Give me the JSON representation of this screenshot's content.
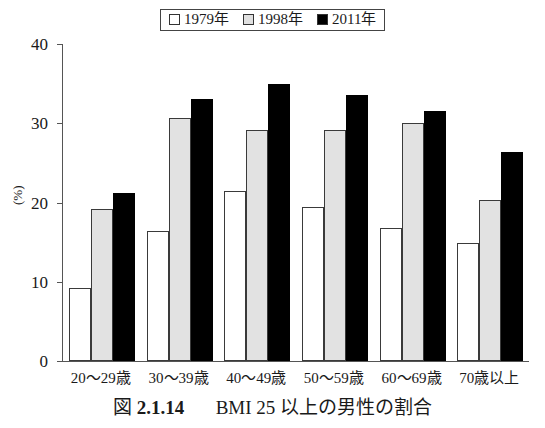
{
  "legend": {
    "entries": [
      {
        "label": "1979年",
        "swatch": "white-square-icon",
        "color": "#ffffff"
      },
      {
        "label": "1998年",
        "swatch": "gray-square-icon",
        "color": "#e2e2e2"
      },
      {
        "label": "2011年",
        "swatch": "black-square-icon",
        "color": "#000000"
      }
    ]
  },
  "axes": {
    "y_title": "(%)",
    "y_ticks": [
      "0",
      "10",
      "20",
      "30",
      "40"
    ]
  },
  "caption": {
    "figure_word": "図",
    "number": "2.1.14",
    "text": "BMI 25 以上の男性の割合"
  },
  "chart_data": {
    "type": "bar",
    "title": "BMI 25 以上の男性の割合",
    "xlabel": "",
    "ylabel": "(%)",
    "ylim": [
      0,
      40
    ],
    "yticks": [
      0,
      10,
      20,
      30,
      40
    ],
    "grid": false,
    "legend_position": "top-center",
    "categories": [
      "20〜29歳",
      "30〜39歳",
      "40〜49歳",
      "50〜59歳",
      "60〜69歳",
      "70歳以上"
    ],
    "series": [
      {
        "name": "1979年",
        "color": "#ffffff",
        "values": [
          9.2,
          16.4,
          21.4,
          19.4,
          16.8,
          14.9
        ]
      },
      {
        "name": "1998年",
        "color": "#e2e2e2",
        "values": [
          19.2,
          30.7,
          29.1,
          29.2,
          30.0,
          20.3
        ]
      },
      {
        "name": "2011年",
        "color": "#000000",
        "values": [
          21.2,
          33.0,
          34.9,
          33.6,
          31.6,
          26.4
        ]
      }
    ]
  }
}
